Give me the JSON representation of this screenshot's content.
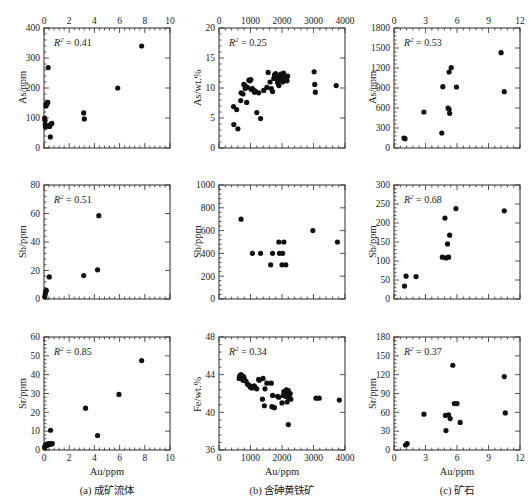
{
  "figure": {
    "columns": [
      {
        "id": "a",
        "caption": "(a) 成矿流体",
        "xlabel": "Au/ppm",
        "xmin": 0,
        "xmax": 10,
        "xticks": [
          0,
          2,
          4,
          6,
          8,
          10
        ],
        "xminor": 5
      },
      {
        "id": "b",
        "caption": "(b) 含砷黄铁矿",
        "xlabel": "Au/ppm",
        "xmin": 0,
        "xmax": 4000,
        "xticks": [
          0,
          1000,
          2000,
          3000,
          4000
        ],
        "xminor": 5
      },
      {
        "id": "c",
        "caption": "(c) 矿石",
        "xlabel": "Au/ppm",
        "xmin": 0,
        "xmax": 12,
        "xticks": [
          0,
          3,
          6,
          9,
          12
        ],
        "xminor": 5
      }
    ]
  },
  "chart_data": [
    {
      "id": "a1",
      "type": "scatter",
      "row": 0,
      "col": 0,
      "title": "",
      "xlabel": "Au/ppm",
      "ylabel": "As/ppm",
      "r2_label": "R2 = 0.41",
      "r2": 0.41,
      "xlim": [
        0,
        10
      ],
      "ylim": [
        0,
        400
      ],
      "xticks": [
        0,
        2,
        4,
        6,
        8,
        10
      ],
      "yticks": [
        0,
        100,
        200,
        300,
        400
      ],
      "grid": false,
      "legend": "none",
      "points": [
        [
          0.05,
          100
        ],
        [
          0.08,
          92
        ],
        [
          0.1,
          78
        ],
        [
          0.12,
          70
        ],
        [
          0.15,
          140
        ],
        [
          0.18,
          148
        ],
        [
          0.22,
          146
        ],
        [
          0.3,
          152
        ],
        [
          0.33,
          268
        ],
        [
          0.4,
          75
        ],
        [
          0.45,
          72
        ],
        [
          0.55,
          80
        ],
        [
          0.62,
          82
        ],
        [
          0.5,
          37
        ],
        [
          3.15,
          117
        ],
        [
          3.2,
          97
        ],
        [
          5.85,
          200
        ],
        [
          7.75,
          340
        ]
      ]
    },
    {
      "id": "b1",
      "type": "scatter",
      "row": 0,
      "col": 1,
      "title": "",
      "xlabel": "Au/ppm",
      "ylabel": "As/wt.%",
      "r2_label": "R2 = 0.25",
      "r2": 0.25,
      "xlim": [
        0,
        4000
      ],
      "ylim": [
        0,
        20
      ],
      "xticks": [
        0,
        1000,
        2000,
        3000,
        4000
      ],
      "yticks": [
        0,
        5,
        10,
        15,
        20
      ],
      "grid": false,
      "legend": "none",
      "points": [
        [
          460,
          6.9
        ],
        [
          470,
          3.9
        ],
        [
          560,
          6.4
        ],
        [
          600,
          3.2
        ],
        [
          690,
          7.9
        ],
        [
          700,
          9.2
        ],
        [
          760,
          9.0
        ],
        [
          790,
          10.6
        ],
        [
          820,
          10.4
        ],
        [
          830,
          9.9
        ],
        [
          860,
          10.2
        ],
        [
          900,
          10.1
        ],
        [
          880,
          7.6
        ],
        [
          950,
          11.3
        ],
        [
          980,
          11.2
        ],
        [
          1010,
          11.4
        ],
        [
          1020,
          9.8
        ],
        [
          1060,
          9.9
        ],
        [
          1100,
          9.6
        ],
        [
          1130,
          9.3
        ],
        [
          1150,
          9.5
        ],
        [
          1200,
          5.9
        ],
        [
          1260,
          9.2
        ],
        [
          1320,
          4.9
        ],
        [
          1420,
          9.6
        ],
        [
          1520,
          10.1
        ],
        [
          1560,
          12.6
        ],
        [
          1620,
          11.0
        ],
        [
          1660,
          9.9
        ],
        [
          1700,
          9.4
        ],
        [
          1740,
          11.6
        ],
        [
          1760,
          12.2
        ],
        [
          1790,
          11.9
        ],
        [
          1800,
          12.4
        ],
        [
          1820,
          12.0
        ],
        [
          1840,
          11.5
        ],
        [
          1860,
          10.9
        ],
        [
          1880,
          11.2
        ],
        [
          1900,
          10.4
        ],
        [
          1940,
          11.6
        ],
        [
          1960,
          12.3
        ],
        [
          1980,
          11.9
        ],
        [
          2000,
          11.4
        ],
        [
          2020,
          11.0
        ],
        [
          2050,
          12.5
        ],
        [
          2080,
          11.8
        ],
        [
          2100,
          11.3
        ],
        [
          2140,
          11.6
        ],
        [
          2160,
          11.2
        ],
        [
          2180,
          12.0
        ],
        [
          3020,
          12.7
        ],
        [
          3040,
          10.6
        ],
        [
          3060,
          9.3
        ],
        [
          3720,
          10.4
        ]
      ]
    },
    {
      "id": "c1",
      "type": "scatter",
      "row": 0,
      "col": 2,
      "title": "",
      "xlabel": "Au/ppm",
      "ylabel": "As/ppm",
      "r2_label": "R2 = 0.53",
      "r2": 0.53,
      "xlim": [
        0,
        12
      ],
      "ylim": [
        0,
        1800
      ],
      "xticks": [
        0,
        3,
        6,
        9,
        12
      ],
      "yticks": [
        0,
        300,
        600,
        900,
        1200,
        1500,
        1800
      ],
      "grid": false,
      "legend": "none",
      "points": [
        [
          0.95,
          150
        ],
        [
          1.05,
          140
        ],
        [
          2.85,
          540
        ],
        [
          4.55,
          225
        ],
        [
          4.65,
          920
        ],
        [
          5.25,
          1140
        ],
        [
          5.45,
          1205
        ],
        [
          5.15,
          600
        ],
        [
          5.25,
          580
        ],
        [
          5.3,
          520
        ],
        [
          5.95,
          915
        ],
        [
          10.2,
          1430
        ],
        [
          10.5,
          845
        ]
      ]
    },
    {
      "id": "a2",
      "type": "scatter",
      "row": 1,
      "col": 0,
      "title": "",
      "xlabel": "Au/ppm",
      "ylabel": "Sb/ppm",
      "r2_label": "R2 = 0.51",
      "r2": 0.51,
      "xlim": [
        0,
        10
      ],
      "ylim": [
        0,
        80
      ],
      "xticks": [
        0,
        2,
        4,
        6,
        8,
        10
      ],
      "yticks": [
        0,
        20,
        40,
        60,
        80
      ],
      "grid": false,
      "legend": "none",
      "points": [
        [
          0.06,
          1.5
        ],
        [
          0.1,
          3.5
        ],
        [
          0.14,
          5.5
        ],
        [
          0.18,
          6.0
        ],
        [
          0.42,
          15.5
        ],
        [
          3.15,
          16.5
        ],
        [
          4.25,
          20.5
        ],
        [
          4.35,
          58.5
        ]
      ]
    },
    {
      "id": "b2",
      "type": "scatter",
      "row": 1,
      "col": 1,
      "title": "",
      "xlabel": "Au/ppm",
      "ylabel": "Sb/ppm",
      "r2_label": "",
      "r2": null,
      "xlim": [
        0,
        4000
      ],
      "ylim": [
        0,
        1000
      ],
      "xticks": [
        0,
        1000,
        2000,
        3000,
        4000
      ],
      "yticks": [
        0,
        200,
        400,
        600,
        800,
        1000
      ],
      "grid": false,
      "legend": "none",
      "points": [
        [
          700,
          700
        ],
        [
          1060,
          400
        ],
        [
          1320,
          400
        ],
        [
          1640,
          300
        ],
        [
          1700,
          400
        ],
        [
          1900,
          500
        ],
        [
          1920,
          400
        ],
        [
          2020,
          400
        ],
        [
          2060,
          500
        ],
        [
          2000,
          300
        ],
        [
          2120,
          300
        ],
        [
          2980,
          600
        ],
        [
          3760,
          500
        ]
      ]
    },
    {
      "id": "c2",
      "type": "scatter",
      "row": 1,
      "col": 2,
      "title": "",
      "xlabel": "Au/ppm",
      "ylabel": "Sb/ppm",
      "r2_label": "R2 = 0.68",
      "r2": 0.68,
      "xlim": [
        0,
        12
      ],
      "ylim": [
        0,
        300
      ],
      "xticks": [
        0,
        3,
        6,
        9,
        12
      ],
      "yticks": [
        0,
        50,
        100,
        150,
        200,
        250,
        300
      ],
      "grid": false,
      "legend": "none",
      "points": [
        [
          1.0,
          34
        ],
        [
          1.15,
          60
        ],
        [
          2.1,
          59
        ],
        [
          4.6,
          110
        ],
        [
          4.95,
          108
        ],
        [
          5.2,
          110
        ],
        [
          5.1,
          145
        ],
        [
          5.3,
          168
        ],
        [
          4.85,
          213
        ],
        [
          5.9,
          238
        ],
        [
          10.5,
          232
        ]
      ]
    },
    {
      "id": "a3",
      "type": "scatter",
      "row": 2,
      "col": 0,
      "title": "",
      "xlabel": "Au/ppm",
      "ylabel": "Sr/ppm",
      "r2_label": "R2 = 0.85",
      "r2": 0.85,
      "xlim": [
        0,
        10
      ],
      "ylim": [
        0,
        60
      ],
      "xticks": [
        0,
        2,
        4,
        6,
        8,
        10
      ],
      "yticks": [
        0,
        10,
        20,
        30,
        40,
        50,
        60
      ],
      "grid": false,
      "legend": "none",
      "points": [
        [
          0.05,
          1.2
        ],
        [
          0.08,
          1.8
        ],
        [
          0.1,
          2.2
        ],
        [
          0.14,
          2.6
        ],
        [
          0.18,
          3.0
        ],
        [
          0.22,
          2.4
        ],
        [
          0.28,
          3.2
        ],
        [
          0.34,
          2.8
        ],
        [
          0.42,
          3.4
        ],
        [
          0.5,
          3.0
        ],
        [
          0.58,
          3.2
        ],
        [
          0.66,
          3.4
        ],
        [
          0.52,
          10.5
        ],
        [
          3.3,
          22.2
        ],
        [
          4.25,
          7.7
        ],
        [
          5.95,
          29.5
        ],
        [
          7.75,
          47.5
        ]
      ]
    },
    {
      "id": "b3",
      "type": "scatter",
      "row": 2,
      "col": 1,
      "title": "",
      "xlabel": "Au/ppm",
      "ylabel": "Fe/wt.%",
      "r2_label": "R2 = 0.34",
      "r2": 0.34,
      "xlim": [
        0,
        4000
      ],
      "ylim": [
        36,
        48
      ],
      "xticks": [
        0,
        1000,
        2000,
        3000,
        4000
      ],
      "yticks": [
        36,
        40,
        44,
        48
      ],
      "grid": false,
      "legend": "none",
      "points": [
        [
          640,
          43.6
        ],
        [
          660,
          43.9
        ],
        [
          700,
          44.0
        ],
        [
          720,
          43.9
        ],
        [
          740,
          43.7
        ],
        [
          760,
          43.4
        ],
        [
          780,
          43.8
        ],
        [
          800,
          43.6
        ],
        [
          860,
          43.3
        ],
        [
          900,
          43.0
        ],
        [
          940,
          42.9
        ],
        [
          980,
          42.8
        ],
        [
          1000,
          42.7
        ],
        [
          1020,
          42.6
        ],
        [
          1060,
          42.7
        ],
        [
          1080,
          42.6
        ],
        [
          1120,
          42.8
        ],
        [
          1160,
          42.6
        ],
        [
          1200,
          42.5
        ],
        [
          1260,
          43.5
        ],
        [
          1280,
          43.4
        ],
        [
          1380,
          41.4
        ],
        [
          1400,
          43.6
        ],
        [
          1440,
          40.7
        ],
        [
          1460,
          42.5
        ],
        [
          1520,
          43.1
        ],
        [
          1660,
          43.1
        ],
        [
          1680,
          40.6
        ],
        [
          1700,
          41.8
        ],
        [
          1760,
          40.5
        ],
        [
          1860,
          41.7
        ],
        [
          1900,
          41.6
        ],
        [
          2000,
          41.0
        ],
        [
          2040,
          41.8
        ],
        [
          2060,
          42.2
        ],
        [
          2100,
          42.0
        ],
        [
          2120,
          41.7
        ],
        [
          2140,
          42.4
        ],
        [
          2160,
          41.1
        ],
        [
          2180,
          41.6
        ],
        [
          2200,
          42.3
        ],
        [
          2220,
          41.9
        ],
        [
          2240,
          41.5
        ],
        [
          2260,
          42.0
        ],
        [
          2280,
          41.4
        ],
        [
          2200,
          38.7
        ],
        [
          3080,
          41.5
        ],
        [
          3180,
          41.5
        ],
        [
          3820,
          41.3
        ]
      ]
    },
    {
      "id": "c3",
      "type": "scatter",
      "row": 2,
      "col": 2,
      "title": "",
      "xlabel": "Au/ppm",
      "ylabel": "Sr/ppm",
      "r2_label": "R2 = 0.37",
      "r2": 0.37,
      "xlim": [
        0,
        12
      ],
      "ylim": [
        0,
        180
      ],
      "xticks": [
        0,
        3,
        6,
        9,
        12
      ],
      "yticks": [
        0,
        30,
        60,
        90,
        120,
        150,
        180
      ],
      "grid": false,
      "legend": "none",
      "points": [
        [
          1.1,
          8
        ],
        [
          1.25,
          10
        ],
        [
          2.85,
          57
        ],
        [
          4.95,
          31
        ],
        [
          4.9,
          55
        ],
        [
          5.2,
          56
        ],
        [
          5.35,
          50
        ],
        [
          5.6,
          135
        ],
        [
          5.75,
          74
        ],
        [
          6.0,
          74
        ],
        [
          6.3,
          44
        ],
        [
          10.5,
          117
        ],
        [
          10.6,
          59
        ]
      ]
    }
  ]
}
